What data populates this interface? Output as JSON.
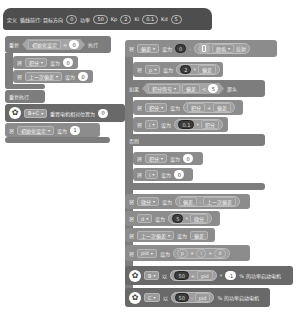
{
  "define_block": {
    "keyword": "定义",
    "name": "循线前行: 目标方向",
    "params": [
      {
        "value": "0"
      },
      {
        "label": "功率",
        "value": "50"
      },
      {
        "label": "Kp",
        "value": "2"
      },
      {
        "label": "Ki",
        "value": "0.1"
      },
      {
        "label": "Kd",
        "value": "5"
      }
    ]
  },
  "left_stack": {
    "repeat_until": {
      "keyword": "重复",
      "var": "初始化设定",
      "op": "=",
      "value": "0",
      "suffix": "执行"
    },
    "set1": {
      "keyword": "将",
      "var": "积分",
      "to": "设为",
      "value": "0"
    },
    "set2": {
      "keyword": "将",
      "var": "上一次偏差",
      "to": "设为",
      "value": "0"
    },
    "repeat_forever": {
      "label": "重复执行"
    },
    "motor": {
      "icon": "motor-icon",
      "port": "B+C",
      "label": "重置电机相对位置为",
      "value": "0"
    },
    "set3": {
      "keyword": "将",
      "var": "初始化设定",
      "to": "设为",
      "value": "1"
    }
  },
  "right_stack": {
    "set_error": {
      "keyword": "将",
      "var": "偏差",
      "to": "设为",
      "value": "0",
      "sensor_icon": "phone-icon",
      "sensor_var": "颜色",
      "sensor_suffix": "反射"
    },
    "set_p": {
      "keyword": "将",
      "var": "p",
      "to": "设为",
      "value": "2",
      "op": "*",
      "operand": "偏差"
    },
    "if_block": {
      "keyword": "如果",
      "left": "积分符号",
      "op_left": "偏差",
      "cmp": "<",
      "value": "5",
      "suffix": "那么"
    },
    "set_integral": {
      "keyword": "将",
      "var": "积分",
      "to": "设为",
      "left": "积分",
      "op": "+",
      "right": "偏差"
    },
    "set_i": {
      "keyword": "将",
      "var": "i",
      "to": "设为",
      "value": "0.1",
      "op": "*",
      "right": "积分"
    },
    "else": {
      "label": "否则"
    },
    "set_integral0": {
      "keyword": "将",
      "var": "积分",
      "to": "设为",
      "value": "0"
    },
    "set_i0": {
      "keyword": "将",
      "var": "i",
      "to": "设为",
      "value": "0"
    },
    "set_diff": {
      "keyword": "将",
      "var": "微分",
      "to": "设为",
      "left": "偏差",
      "op": "-",
      "right": "上一次偏差"
    },
    "set_d": {
      "keyword": "将",
      "var": "d",
      "to": "设为",
      "value": "5",
      "op": "*",
      "right": "微分"
    },
    "set_last": {
      "keyword": "将",
      "var": "上一次偏差",
      "to": "设为",
      "value": "偏差"
    },
    "set_pid": {
      "keyword": "将",
      "var": "pid",
      "to": "设为",
      "a": "p",
      "b": "i",
      "c": "d",
      "op": "+"
    },
    "motor_b": {
      "icon": "motor-icon",
      "port": "B",
      "label": "以",
      "value": "50",
      "op": "+",
      "operand": "pid",
      "mul": "*",
      "factor": "-1",
      "suffix": "% 的功率启动电机"
    },
    "motor_c": {
      "icon": "motor-icon",
      "port": "C",
      "label": "以",
      "value": "50",
      "op": "-",
      "operand": "pid",
      "suffix": "% 的功率启动电机"
    }
  }
}
